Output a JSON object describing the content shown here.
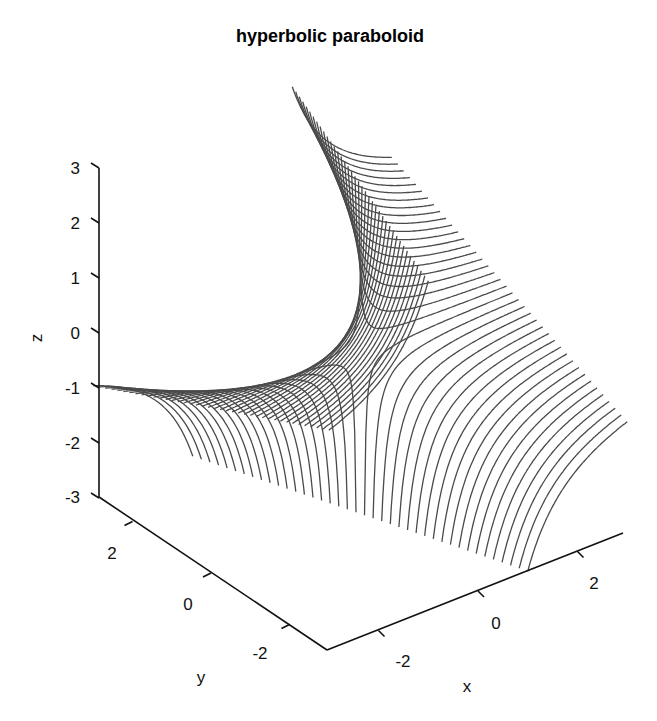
{
  "chart_data": {
    "type": "surface-mesh-3d",
    "title": "hyperbolic paraboloid",
    "xlabel": "x",
    "ylabel": "y",
    "zlabel": "z",
    "xlim": [
      -3,
      3
    ],
    "ylim": [
      -3,
      3
    ],
    "zlim": [
      -3,
      3
    ],
    "x_ticks": [
      -2,
      0,
      2
    ],
    "y_ticks": [
      -2,
      0,
      2
    ],
    "z_ticks": [
      -3,
      -2,
      -1,
      0,
      1,
      2,
      3
    ],
    "function": "z = y / x (clipped to zlim)",
    "mesh": {
      "line_direction": "constant-y curves along x",
      "y_line_count": 40,
      "x_samples": 241
    },
    "grid": false,
    "legend": null,
    "line_color": "#4a4a4a"
  },
  "labels": {
    "title": "hyperbolic paraboloid",
    "x": "x",
    "y": "y",
    "z": "z",
    "z_ticks": [
      "3",
      "2",
      "1",
      "0",
      "-1",
      "-2",
      "-3"
    ],
    "y_ticks": [
      "2",
      "0",
      "-2"
    ],
    "x_ticks": [
      "-2",
      "0",
      "2"
    ]
  }
}
